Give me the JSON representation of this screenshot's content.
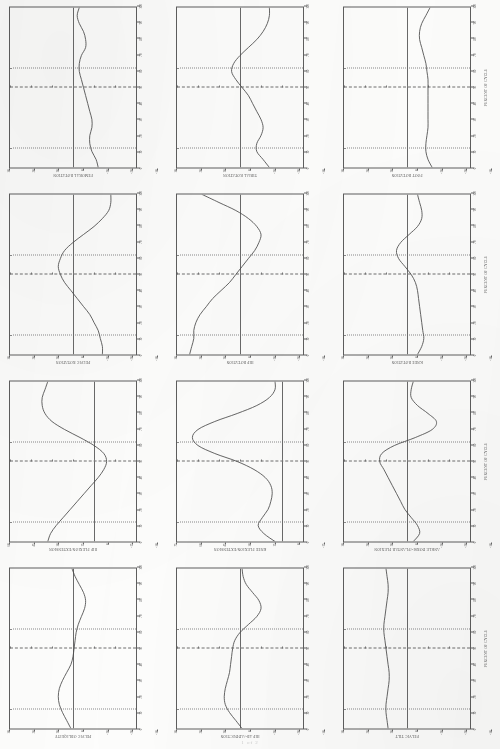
{
  "document": {
    "type": "clinical-gait-kinematics-report",
    "orientation": "landscape-rotated-90ccw",
    "footer_mark": "1 of 2"
  },
  "axes": {
    "xlabel": "PERCENT OF CYCLE",
    "ylabel": "ANGLE (DEGREES)",
    "xlim": [
      0,
      100
    ],
    "xticks": [
      0,
      10,
      20,
      30,
      40,
      50,
      60,
      70,
      80,
      90,
      100
    ],
    "grid": {
      "toe_off_dotted_1": 12,
      "midline_dashdot": 50,
      "toe_off_dotted_2": 62
    }
  },
  "chart_data": [
    {
      "type": "line",
      "title": "PELVIC TILT",
      "xlabel": "PERCENT OF CYCLE",
      "ylabel": "ANGLE (DEGREES)",
      "xlim": [
        0,
        100
      ],
      "ylim": [
        -30,
        30
      ],
      "yticks": [
        -30,
        -20,
        -10,
        0,
        10,
        20,
        30
      ],
      "ytick_labels": [
        "-30",
        "-20",
        "-10",
        "0",
        "10",
        "20",
        "30"
      ],
      "x": [
        0,
        5,
        10,
        15,
        20,
        25,
        30,
        35,
        40,
        45,
        50,
        55,
        60,
        65,
        70,
        75,
        80,
        85,
        90,
        95,
        100
      ],
      "values": [
        9,
        9.5,
        10,
        10,
        9.5,
        9,
        8.5,
        8.5,
        9,
        9.5,
        10,
        10.5,
        11,
        11,
        10.5,
        10,
        9.5,
        9,
        9,
        9.5,
        10
      ]
    },
    {
      "type": "line",
      "title": "HIP AB-/ADDUCTION",
      "xlabel": "PERCENT OF CYCLE",
      "ylabel": "ANGLE (DEGREES)",
      "xlim": [
        0,
        100
      ],
      "ylim": [
        -30,
        30
      ],
      "yticks": [
        -30,
        -20,
        -10,
        0,
        10,
        20,
        30
      ],
      "ytick_labels": [
        "-30",
        "-20",
        "-10",
        "0",
        "10",
        "20",
        "30"
      ],
      "x": [
        0,
        5,
        10,
        15,
        20,
        25,
        30,
        35,
        40,
        45,
        50,
        55,
        60,
        65,
        70,
        75,
        80,
        85,
        90,
        95,
        100
      ],
      "values": [
        -1,
        2,
        5,
        7,
        7.5,
        7,
        6,
        5,
        4.5,
        4,
        3.5,
        2.5,
        0,
        -4,
        -8,
        -10,
        -9,
        -6,
        -3,
        -1.5,
        -1
      ]
    },
    {
      "type": "line",
      "title": "PELVIC OBLIQUITY",
      "xlabel": "PERCENT OF CYCLE",
      "ylabel": "ANGLE (DEGREES)",
      "xlim": [
        0,
        100
      ],
      "ylim": [
        -30,
        30
      ],
      "yticks": [
        -30,
        -20,
        -10,
        0,
        10,
        20,
        30
      ],
      "ytick_labels": [
        "-30",
        "-20",
        "-10",
        "0",
        "10",
        "20",
        "30"
      ],
      "x": [
        0,
        5,
        10,
        15,
        20,
        25,
        30,
        35,
        40,
        45,
        50,
        55,
        60,
        65,
        70,
        75,
        80,
        85,
        90,
        95,
        100
      ],
      "values": [
        1,
        3,
        5,
        6.5,
        7,
        6.5,
        5,
        3,
        1,
        0,
        -0.5,
        -1,
        -1.5,
        -2.5,
        -4,
        -5.5,
        -6,
        -5,
        -3,
        -1,
        0.5
      ]
    },
    {
      "type": "line",
      "title": "ANKLE DORSI-/PLANTAR FLEXION",
      "xlabel": "PERCENT OF CYCLE",
      "ylabel": "ANGLE (DEGREES)",
      "xlim": [
        0,
        100
      ],
      "ylim": [
        -30,
        30
      ],
      "yticks": [
        -30,
        -20,
        -10,
        0,
        10,
        20,
        30
      ],
      "ytick_labels": [
        "-30",
        "-20",
        "-10",
        "0",
        "10",
        "20",
        "30"
      ],
      "x": [
        0,
        5,
        10,
        15,
        20,
        25,
        30,
        35,
        40,
        45,
        50,
        55,
        60,
        65,
        70,
        75,
        80,
        85,
        90,
        95,
        100
      ],
      "values": [
        -3,
        -6,
        -5,
        -2,
        1,
        3,
        5,
        7,
        9,
        11,
        13,
        12,
        6,
        -4,
        -12,
        -14,
        -10,
        -5,
        -2,
        -2,
        -3
      ]
    },
    {
      "type": "line",
      "title": "KNEE FLEXION/EXTENSION",
      "xlabel": "PERCENT OF CYCLE",
      "ylabel": "ANGLE (DEGREES)",
      "xlim": [
        0,
        100
      ],
      "ylim": [
        -15,
        75
      ],
      "yticks": [
        -15,
        0,
        15,
        30,
        45,
        60,
        75
      ],
      "ytick_labels": [
        "-15",
        "0",
        "15",
        "30",
        "45",
        "60",
        "75"
      ],
      "x": [
        0,
        5,
        10,
        15,
        20,
        25,
        30,
        35,
        40,
        45,
        50,
        55,
        60,
        65,
        70,
        75,
        80,
        85,
        90,
        95,
        100
      ],
      "values": [
        5,
        13,
        17,
        14,
        10,
        8,
        7,
        8,
        12,
        20,
        32,
        48,
        60,
        64,
        60,
        48,
        32,
        18,
        9,
        5,
        5
      ]
    },
    {
      "type": "line",
      "title": "HIP FLEXION/EXTENSION",
      "xlabel": "PERCENT OF CYCLE",
      "ylabel": "ANGLE (DEGREES)",
      "xlim": [
        0,
        100
      ],
      "ylim": [
        -30,
        60
      ],
      "yticks": [
        -30,
        -15,
        0,
        15,
        30,
        45,
        60
      ],
      "ytick_labels": [
        "-30",
        "-15",
        "0",
        "15",
        "30",
        "45",
        "60"
      ],
      "x": [
        0,
        5,
        10,
        15,
        20,
        25,
        30,
        35,
        40,
        45,
        50,
        55,
        60,
        65,
        70,
        75,
        80,
        85,
        90,
        95,
        100
      ],
      "values": [
        33,
        31,
        27,
        22,
        17,
        12,
        7,
        2,
        -3,
        -7,
        -9,
        -7,
        0,
        10,
        21,
        30,
        35,
        37,
        37,
        35,
        33
      ]
    },
    {
      "type": "line",
      "title": "KNEE ROTATION",
      "xlabel": "PERCENT OF CYCLE",
      "ylabel": "ANGLE (DEGREES)",
      "xlim": [
        0,
        100
      ],
      "ylim": [
        -30,
        30
      ],
      "yticks": [
        -30,
        -20,
        -10,
        0,
        10,
        20,
        30
      ],
      "ytick_labels": [
        "-30",
        "-20",
        "-10",
        "0",
        "10",
        "20",
        "30"
      ],
      "x": [
        0,
        5,
        10,
        15,
        20,
        25,
        30,
        35,
        40,
        45,
        50,
        55,
        60,
        65,
        70,
        75,
        80,
        85,
        90,
        95,
        100
      ],
      "values": [
        -5,
        -7,
        -8,
        -7.5,
        -7,
        -6.5,
        -6,
        -5.5,
        -5,
        -4,
        -2,
        1,
        4,
        5,
        3,
        -1,
        -5,
        -7,
        -7,
        -6,
        -5
      ]
    },
    {
      "type": "line",
      "title": "HIP ROTATION",
      "xlabel": "PERCENT OF CYCLE",
      "ylabel": "ANGLE (DEGREES)",
      "xlim": [
        0,
        100
      ],
      "ylim": [
        -30,
        30
      ],
      "yticks": [
        -30,
        -20,
        -10,
        0,
        10,
        20,
        30
      ],
      "ytick_labels": [
        "-30",
        "-20",
        "-10",
        "0",
        "10",
        "20",
        "30"
      ],
      "x": [
        0,
        5,
        10,
        15,
        20,
        25,
        30,
        35,
        40,
        45,
        50,
        55,
        60,
        65,
        70,
        75,
        80,
        85,
        90,
        95,
        100
      ],
      "values": [
        24,
        23,
        22,
        22,
        21,
        19,
        16,
        13,
        9,
        5,
        2,
        -1,
        -4,
        -7,
        -9,
        -10,
        -8,
        -4,
        2,
        10,
        18
      ]
    },
    {
      "type": "line",
      "title": "PELVIC ROTATION",
      "xlabel": "PERCENT OF CYCLE",
      "ylabel": "ANGLE (DEGREES)",
      "xlim": [
        0,
        100
      ],
      "ylim": [
        -30,
        30
      ],
      "yticks": [
        -30,
        -20,
        -10,
        0,
        10,
        20,
        30
      ],
      "ytick_labels": [
        "-30",
        "-20",
        "-10",
        "0",
        "10",
        "20",
        "30"
      ],
      "x": [
        0,
        5,
        10,
        15,
        20,
        25,
        30,
        35,
        40,
        45,
        50,
        55,
        60,
        65,
        70,
        75,
        80,
        85,
        90,
        95,
        100
      ],
      "values": [
        -14,
        -14,
        -13,
        -12,
        -10,
        -8,
        -5,
        -2,
        1,
        4,
        6,
        7,
        6,
        4,
        0,
        -5,
        -10,
        -14,
        -17,
        -18,
        -18
      ]
    },
    {
      "type": "line",
      "title": "FOOT ROTATION",
      "xlabel": "PERCENT OF CYCLE",
      "ylabel": "ANGLE (DEGREES)",
      "xlim": [
        0,
        100
      ],
      "ylim": [
        -30,
        30
      ],
      "yticks": [
        -30,
        -20,
        -10,
        0,
        10,
        20,
        30
      ],
      "ytick_labels": [
        "-30",
        "-20",
        "-10",
        "0",
        "10",
        "20",
        "30"
      ],
      "x": [
        0,
        5,
        10,
        15,
        20,
        25,
        30,
        35,
        40,
        45,
        50,
        55,
        60,
        65,
        70,
        75,
        80,
        85,
        90,
        95,
        100
      ],
      "values": [
        -12,
        -10,
        -9,
        -9,
        -9.5,
        -10,
        -10,
        -10,
        -10,
        -10,
        -10,
        -10,
        -9.5,
        -9,
        -8,
        -7,
        -6,
        -6,
        -7,
        -9,
        -11
      ]
    },
    {
      "type": "line",
      "title": "TIBIAL ROTATION",
      "xlabel": "PERCENT OF CYCLE",
      "ylabel": "ANGLE (DEGREES)",
      "xlim": [
        0,
        100
      ],
      "ylim": [
        -30,
        30
      ],
      "yticks": [
        -30,
        -20,
        -10,
        0,
        10,
        20,
        30
      ],
      "ytick_labels": [
        "-30",
        "-20",
        "-10",
        "0",
        "10",
        "20",
        "30"
      ],
      "x": [
        0,
        5,
        10,
        15,
        20,
        25,
        30,
        35,
        40,
        45,
        50,
        55,
        60,
        65,
        70,
        75,
        80,
        85,
        90,
        95,
        100
      ],
      "values": [
        -14,
        -11,
        -8,
        -8,
        -10,
        -11,
        -10,
        -8,
        -6,
        -4,
        -1,
        2,
        4,
        3,
        0,
        -4,
        -8,
        -11,
        -13,
        -14,
        -14
      ]
    },
    {
      "type": "line",
      "title": "FEMORAL ROTATION",
      "xlabel": "PERCENT OF CYCLE",
      "ylabel": "ANGLE (DEGREES)",
      "xlim": [
        0,
        100
      ],
      "ylim": [
        -30,
        30
      ],
      "yticks": [
        -30,
        -20,
        -10,
        0,
        10,
        20,
        30
      ],
      "ytick_labels": [
        "-30",
        "-20",
        "-10",
        "0",
        "10",
        "20",
        "30"
      ],
      "x": [
        0,
        5,
        10,
        15,
        20,
        25,
        30,
        35,
        40,
        45,
        50,
        55,
        60,
        65,
        70,
        75,
        80,
        85,
        90,
        95,
        100
      ],
      "values": [
        -12,
        -11,
        -9,
        -8,
        -8,
        -9,
        -9,
        -8,
        -7,
        -6,
        -5,
        -4,
        -3,
        -3,
        -4,
        -6,
        -6,
        -5,
        -3,
        -2,
        -3
      ]
    }
  ],
  "layout": {
    "rows": 4,
    "columns": 3,
    "panel_order": [
      "FEMORAL ROTATION",
      "TIBIAL ROTATION",
      "FOOT ROTATION",
      "PELVIC ROTATION",
      "HIP ROTATION",
      "KNEE ROTATION",
      "HIP FLEXION/EXTENSION",
      "KNEE FLEXION/EXTENSION",
      "ANKLE DORSI-/PLANTAR FLEXION",
      "PELVIC OBLIQUITY",
      "HIP AB-/ADDUCTION",
      "PELVIC TILT"
    ]
  }
}
